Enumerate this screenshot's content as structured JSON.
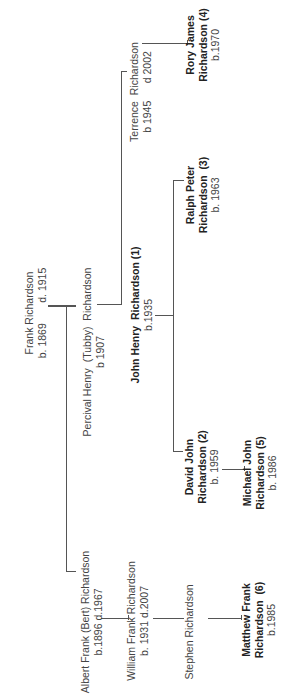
{
  "diagram": {
    "type": "family-tree",
    "orientation": "rotated-90-ccw",
    "line_color": "#555555",
    "people": [
      {
        "id": "frank",
        "name": "Frank Richardson",
        "dates": "b. 1869       d. 1915",
        "bold": false
      },
      {
        "id": "albert",
        "name": "Albert Frank (Bert) Richardson",
        "dates": "b.1896 d.1967",
        "bold": false
      },
      {
        "id": "percival",
        "name": "Percival Henry  (Tubby)  Richardson",
        "dates": "b 1907",
        "bold": false
      },
      {
        "id": "william",
        "name": "William Frank Richardson",
        "dates": "b. 1931 d.2007",
        "bold": false
      },
      {
        "id": "john",
        "name": "John Henry  Richardson (1)",
        "dates": "b.1935",
        "bold": true
      },
      {
        "id": "terrence",
        "name": "Terrence  Richardson",
        "dates": "b 1945      d 2002",
        "bold": false
      },
      {
        "id": "stephen",
        "name": "Stephen Richardson",
        "dates": "",
        "bold": false
      },
      {
        "id": "david",
        "name1": "David John",
        "name2": "Richardson (2)",
        "dates": "b. 1959",
        "bold": true
      },
      {
        "id": "ralph",
        "name1": "Ralph Peter",
        "name2": "Richardson  (3)",
        "dates": "b. 1963",
        "bold": true
      },
      {
        "id": "rory",
        "name1": "Rory James",
        "name2": "Richardson (4)",
        "dates": "b.1970",
        "bold": true
      },
      {
        "id": "michael",
        "name1": "Michael John",
        "name2": "Richardson (5)",
        "dates": "b. 1986",
        "bold": true
      },
      {
        "id": "matthew",
        "name1": "Matthew Frank",
        "name2": "Richardson  (6)",
        "dates": "b.1985",
        "bold": true
      }
    ],
    "relationships": [
      {
        "parent": "Frank Richardson",
        "children": [
          "Albert Frank (Bert) Richardson",
          "Percival Henry (Tubby) Richardson"
        ]
      },
      {
        "parent": "Percival Henry (Tubby) Richardson",
        "children": [
          "John Henry Richardson (1)",
          "Terrence Richardson"
        ]
      },
      {
        "parent": "John Henry Richardson (1)",
        "children": [
          "David John Richardson (2)",
          "Ralph Peter Richardson (3)"
        ]
      },
      {
        "parent": "Terrence Richardson",
        "children": [
          "Rory James Richardson (4)"
        ]
      },
      {
        "parent": "David John Richardson (2)",
        "children": [
          "Michael John Richardson (5)"
        ]
      },
      {
        "parent": "Albert Frank (Bert) Richardson",
        "children": [
          "William Frank Richardson"
        ]
      },
      {
        "parent": "William Frank Richardson",
        "children": [
          "Stephen Richardson"
        ]
      },
      {
        "parent": "Stephen Richardson",
        "children": [
          "Matthew Frank Richardson (6)"
        ]
      }
    ]
  }
}
